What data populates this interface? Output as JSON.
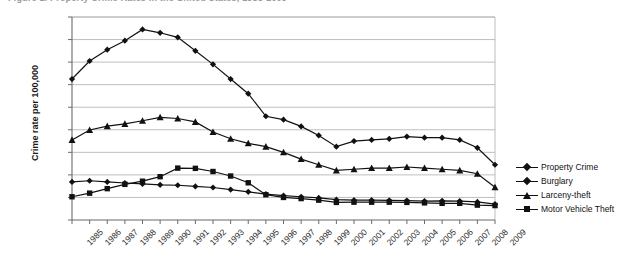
{
  "title_sliver": "Figure 1. Property Crime Rates in the United States, 1985-2009",
  "axis": {
    "ylabel": "Crime rate per 100,000",
    "yticks": [
      "0",
      "1,000",
      "2,000",
      "3,000",
      "4,000",
      "5,000",
      "6,000",
      "7,000",
      "8,000",
      "9,000"
    ]
  },
  "legend": {
    "items": [
      {
        "label": "Property Crime",
        "marker": "diamond"
      },
      {
        "label": "Burglary",
        "marker": "diamond"
      },
      {
        "label": "Larceny-theft",
        "marker": "triangle"
      },
      {
        "label": "Motor Vehicle Theft",
        "marker": "square"
      }
    ]
  },
  "chart_data": {
    "type": "line",
    "title": "Figure 1. Property Crime Rates in the United States, 1985-2009",
    "xlabel": "",
    "ylabel": "Crime rate per 100,000",
    "ylim": [
      0,
      9000
    ],
    "ytick_step": 1000,
    "grid": true,
    "legend_position": "right",
    "categories": [
      "1985",
      "1986",
      "1987",
      "1988",
      "1989",
      "1990",
      "1991",
      "1992",
      "1993",
      "1994",
      "1995",
      "1996",
      "1997",
      "1998",
      "1999",
      "2000",
      "2001",
      "2002",
      "2003",
      "2004",
      "2005",
      "2006",
      "2007",
      "2008",
      "2009"
    ],
    "series": [
      {
        "name": "Property Crime",
        "marker": "diamond",
        "color": "#111111",
        "values": [
          6250,
          7050,
          7550,
          7950,
          8450,
          8300,
          8100,
          7500,
          6900,
          6250,
          5600,
          4600,
          4450,
          4150,
          3750,
          3250,
          3500,
          3550,
          3600,
          3700,
          3650,
          3650,
          3550,
          3200,
          2450
        ]
      },
      {
        "name": "Burglary",
        "marker": "diamond",
        "color": "#111111",
        "values": [
          1690,
          1740,
          1690,
          1640,
          1600,
          1560,
          1540,
          1490,
          1440,
          1350,
          1250,
          1150,
          1080,
          1030,
          980,
          900,
          880,
          880,
          870,
          860,
          840,
          850,
          840,
          800,
          700
        ]
      },
      {
        "name": "Larceny-theft",
        "marker": "triangle",
        "color": "#111111",
        "values": [
          3550,
          3990,
          4160,
          4260,
          4400,
          4550,
          4500,
          4350,
          3900,
          3600,
          3400,
          3250,
          3000,
          2700,
          2450,
          2200,
          2250,
          2300,
          2300,
          2350,
          2300,
          2250,
          2200,
          2050,
          1450
        ]
      },
      {
        "name": "Motor Vehicle Theft",
        "marker": "square",
        "color": "#111111",
        "values": [
          1030,
          1190,
          1390,
          1580,
          1720,
          1920,
          2300,
          2290,
          2150,
          1950,
          1650,
          1120,
          1000,
          950,
          880,
          780,
          790,
          790,
          790,
          780,
          760,
          740,
          740,
          660,
          640
        ]
      }
    ]
  }
}
